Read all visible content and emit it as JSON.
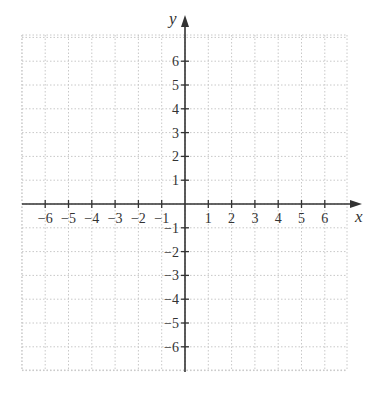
{
  "diagram": {
    "type": "coordinate-plane",
    "x_axis": {
      "label": "x",
      "min": -6,
      "max": 6,
      "tick_labels": [
        "−6",
        "−5",
        "−4",
        "−3",
        "−2",
        "−1",
        "1",
        "2",
        "3",
        "4",
        "5",
        "6"
      ]
    },
    "y_axis": {
      "label": "y",
      "min": -6,
      "max": 6,
      "tick_labels": [
        "6",
        "5",
        "4",
        "3",
        "2",
        "1",
        "−1",
        "−2",
        "−3",
        "−4",
        "−5",
        "−6"
      ]
    },
    "grid": {
      "style": "dotted",
      "color": "#c8c8c8",
      "step": 1
    },
    "axis_color": "#333333"
  }
}
